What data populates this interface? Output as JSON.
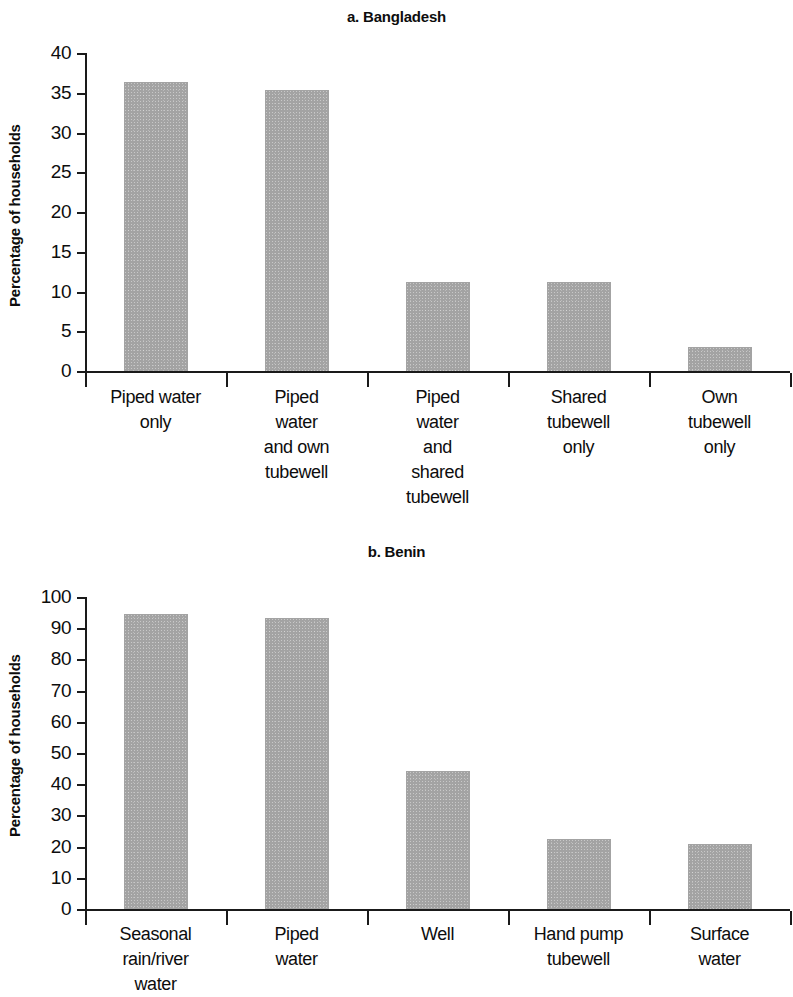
{
  "figure": {
    "ylabel": "Percentage of households"
  },
  "chart_data": [
    {
      "type": "bar",
      "title": "a. Bangladesh",
      "xlabel": "",
      "ylabel": "Percentage of households",
      "ylim": [
        0,
        40
      ],
      "yticks": [
        0,
        5,
        10,
        15,
        20,
        25,
        30,
        35,
        40
      ],
      "grid": false,
      "legend": "none",
      "bar_color": "#a3a3a3",
      "categories": [
        "Piped water only",
        "Piped water and own tubewell",
        "Piped water and shared tubewell",
        "Shared tubewell only",
        "Own tubewell only"
      ],
      "category_lines": [
        [
          "Piped water",
          "only"
        ],
        [
          "Piped",
          "water",
          "and own",
          "tubewell"
        ],
        [
          "Piped",
          "water",
          "and",
          "shared",
          "tubewell"
        ],
        [
          "Shared",
          "tubewell",
          "only"
        ],
        [
          "Own",
          "tubewell",
          "only"
        ]
      ],
      "values": [
        36.3,
        35.3,
        11.2,
        11.2,
        3.0
      ]
    },
    {
      "type": "bar",
      "title": "b. Benin",
      "xlabel": "",
      "ylabel": "Percentage of households",
      "ylim": [
        0,
        100
      ],
      "yticks": [
        0,
        10,
        20,
        30,
        40,
        50,
        60,
        70,
        80,
        90,
        100
      ],
      "grid": false,
      "legend": "none",
      "bar_color": "#a3a3a3",
      "categories": [
        "Seasonal rain/river water",
        "Piped water",
        "Well",
        "Hand pump tubewell",
        "Surface water"
      ],
      "category_lines": [
        [
          "Seasonal",
          "rain/river",
          "water"
        ],
        [
          "Piped",
          "water"
        ],
        [
          "Well"
        ],
        [
          "Hand pump",
          "tubewell"
        ],
        [
          "Surface",
          "water"
        ]
      ],
      "values": [
        94.7,
        93.3,
        44.3,
        22.4,
        20.8
      ]
    }
  ]
}
